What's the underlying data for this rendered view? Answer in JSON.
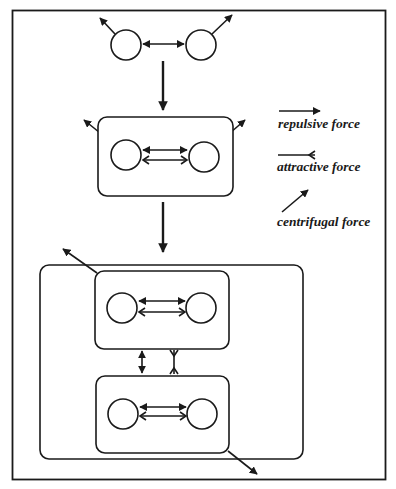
{
  "figure": {
    "colors": {
      "line": "#1a1a1a",
      "background": "#ffffff"
    }
  },
  "legend": {
    "items": [
      {
        "id": "repulsive",
        "label": "repulsive force",
        "icon": "arrow-filled-head-icon"
      },
      {
        "id": "attractive",
        "label": "attractive force",
        "icon": "arrow-open-v-head-icon"
      },
      {
        "id": "centrifugal",
        "label": "centrifugal force",
        "icon": "diagonal-arrow-icon"
      }
    ]
  },
  "stages": [
    {
      "id": "stage-1",
      "description": "Two free nodes with repulsive force and centrifugal forces"
    },
    {
      "id": "stage-2",
      "description": "Two nodes grouped in a cluster with repulsive and attractive forces"
    },
    {
      "id": "stage-3",
      "description": "Two clusters grouped in a super-cluster with inter-cluster forces"
    }
  ]
}
